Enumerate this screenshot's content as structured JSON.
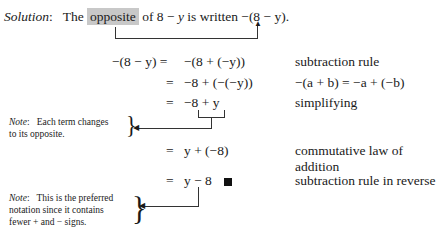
{
  "solution": {
    "label": "Solution",
    "intro_before": "The",
    "highlight": "opposite",
    "intro_mid": "of 8 −",
    "var": "y",
    "intro_after": "is written",
    "expr": "−(8 − y)."
  },
  "steps": [
    {
      "lhs": "−(8 − y) =",
      "rhs": "−(8 + (−y))",
      "reason": "subtraction rule"
    },
    {
      "lhs": "=",
      "rhs": "−8 + (−(−y))",
      "reason": "−(a + b) = −a + (−b)"
    },
    {
      "lhs": "=",
      "rhs": "−8 + y",
      "reason": "simplifying"
    },
    {
      "lhs": "=",
      "rhs": "y + (−8)",
      "reason": "commutative law of",
      "reason2": "addition"
    },
    {
      "lhs": "=",
      "rhs": "y − 8",
      "reason": "subtraction rule in reverse"
    }
  ],
  "notes": [
    {
      "label": "Note",
      "line1": "Each term changes",
      "line2": "to its opposite."
    },
    {
      "label": "Note",
      "line1": "This is the preferred",
      "line2": "notation since it contains",
      "line3": "fewer + and − signs."
    }
  ]
}
